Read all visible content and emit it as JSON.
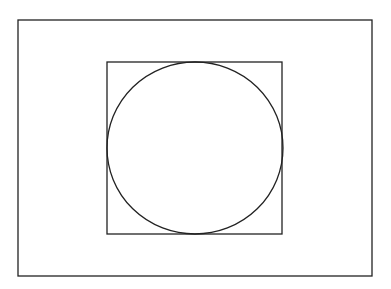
{
  "diagram": {
    "background": "#ffffff",
    "stroke_color": "#222222",
    "outer_rect": {
      "x": 18,
      "y": 20,
      "w": 354,
      "h": 256
    },
    "inner_square": {
      "x": 107,
      "y": 62,
      "w": 175,
      "h": 172
    },
    "circle": {
      "cx": 195,
      "cy": 148,
      "rx": 88,
      "ry": 86
    }
  }
}
